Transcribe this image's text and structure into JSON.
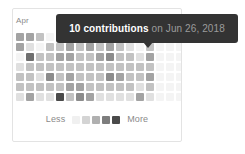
{
  "card": {
    "month_labels": [
      "Apr"
    ]
  },
  "tooltip": {
    "count_label": "10 contributions",
    "rest_label": "on Jun 26, 2018",
    "count": 10,
    "date": "Jun 26, 2018",
    "background_color": "#333333",
    "count_color": "#ffffff",
    "rest_color": "#9b9b9b"
  },
  "legend": {
    "less_label": "Less",
    "more_label": "More",
    "swatch_colors": [
      "#f0f0f0",
      "#d4d4d4",
      "#b0b0b0",
      "#7d7d7d",
      "#4a4a4a"
    ]
  },
  "chart_data": {
    "type": "heatmap",
    "title": "",
    "xlabel": "",
    "ylabel": "",
    "legend_position": "bottom-center",
    "grid": false,
    "columns": 17,
    "rows": 7,
    "level_colors": [
      "#f4f4f4",
      "#e0e0e0",
      "#c2c2c2",
      "#a3a3a3",
      "#8c8c8c",
      "#6f6f6f",
      "#4a4a4a"
    ],
    "highlight": {
      "column": 9,
      "row": 0,
      "value": 10,
      "date": "Jun 26, 2018"
    },
    "values": [
      [
        3,
        3,
        2,
        0,
        0,
        0,
        0,
        0,
        0,
        6,
        0,
        0,
        0,
        0,
        0,
        0,
        0
      ],
      [
        3,
        1,
        0,
        2,
        2,
        3,
        2,
        3,
        2,
        3,
        2,
        1,
        0,
        2,
        0,
        0,
        0
      ],
      [
        0,
        5,
        2,
        2,
        3,
        3,
        2,
        2,
        3,
        4,
        2,
        2,
        1,
        3,
        0,
        0,
        0
      ],
      [
        1,
        2,
        2,
        2,
        2,
        2,
        2,
        2,
        2,
        2,
        2,
        2,
        2,
        2,
        0,
        0,
        0
      ],
      [
        2,
        2,
        1,
        4,
        2,
        3,
        2,
        2,
        2,
        4,
        3,
        2,
        2,
        3,
        0,
        0,
        0
      ],
      [
        2,
        2,
        2,
        2,
        2,
        3,
        3,
        2,
        2,
        2,
        2,
        2,
        1,
        2,
        0,
        0,
        0
      ],
      [
        1,
        3,
        1,
        1,
        6,
        2,
        4,
        3,
        1,
        1,
        1,
        1,
        3,
        1,
        0,
        0,
        0
      ]
    ]
  }
}
